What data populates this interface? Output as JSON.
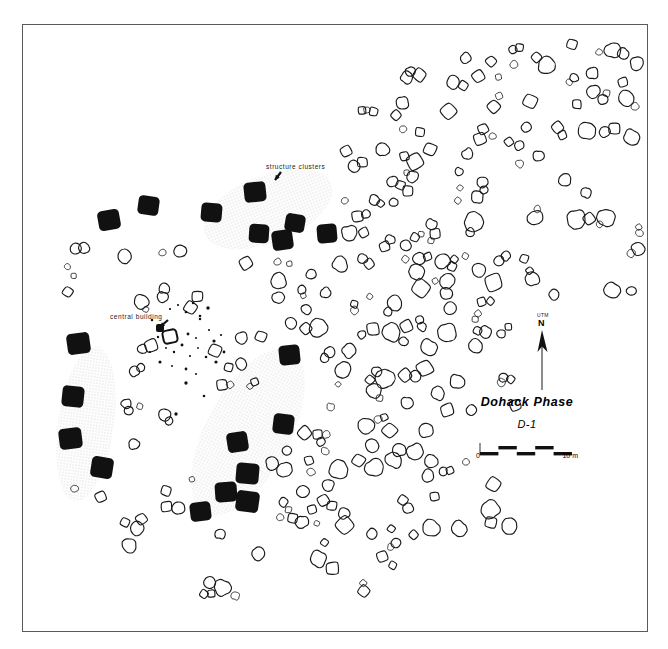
{
  "figure": {
    "type": "archaeological-site-plan",
    "border": {
      "x": 22,
      "y": 24,
      "width": 626,
      "height": 608,
      "stroke": "#59595e"
    }
  },
  "annotations": {
    "structure_clusters_label": "structure clusters",
    "central_building_label": "central building"
  },
  "legend": {
    "title": "Dohack Phase",
    "subtitle": "D-1",
    "scale_min_label": "0",
    "scale_max_label": "10 m",
    "scale_segments": 5
  },
  "north_arrow": {
    "datum_label": "UTM",
    "direction_label": "N"
  },
  "colors": {
    "structure_fill": "#111111",
    "feature_stroke": "#1a1a1a",
    "cluster_halo": "#e8e8e8",
    "border": "#59595e",
    "background": "#ffffff"
  },
  "map_data": {
    "cluster_halos": [
      {
        "cx": 268,
        "cy": 209,
        "rx": 68,
        "ry": 34,
        "rot": -22
      },
      {
        "cx": 86,
        "cy": 424,
        "rx": 28,
        "ry": 78,
        "rot": 8
      },
      {
        "cx": 248,
        "cy": 432,
        "rx": 42,
        "ry": 92,
        "rot": 28
      }
    ],
    "structures": [
      {
        "x": 244,
        "y": 182,
        "w": 22,
        "h": 20,
        "rot": -6
      },
      {
        "x": 201,
        "y": 203,
        "w": 21,
        "h": 19,
        "rot": 5
      },
      {
        "x": 98,
        "y": 210,
        "w": 22,
        "h": 20,
        "rot": -10
      },
      {
        "x": 138,
        "y": 196,
        "w": 21,
        "h": 19,
        "rot": 8
      },
      {
        "x": 249,
        "y": 224,
        "w": 20,
        "h": 19,
        "rot": 4
      },
      {
        "x": 272,
        "y": 230,
        "w": 21,
        "h": 20,
        "rot": -8
      },
      {
        "x": 285,
        "y": 214,
        "w": 20,
        "h": 18,
        "rot": 10
      },
      {
        "x": 317,
        "y": 224,
        "w": 20,
        "h": 19,
        "rot": -5
      },
      {
        "x": 67,
        "y": 333,
        "w": 23,
        "h": 21,
        "rot": -8
      },
      {
        "x": 62,
        "y": 386,
        "w": 22,
        "h": 21,
        "rot": 6
      },
      {
        "x": 59,
        "y": 428,
        "w": 23,
        "h": 21,
        "rot": -7
      },
      {
        "x": 91,
        "y": 457,
        "w": 22,
        "h": 21,
        "rot": 9
      },
      {
        "x": 279,
        "y": 345,
        "w": 21,
        "h": 20,
        "rot": -6
      },
      {
        "x": 273,
        "y": 414,
        "w": 21,
        "h": 20,
        "rot": 7
      },
      {
        "x": 227,
        "y": 432,
        "w": 21,
        "h": 20,
        "rot": -9
      },
      {
        "x": 236,
        "y": 463,
        "w": 23,
        "h": 21,
        "rot": 5
      },
      {
        "x": 215,
        "y": 482,
        "w": 22,
        "h": 20,
        "rot": -4
      },
      {
        "x": 236,
        "y": 491,
        "w": 23,
        "h": 21,
        "rot": 8
      },
      {
        "x": 190,
        "y": 502,
        "w": 21,
        "h": 19,
        "rot": -7
      }
    ],
    "central_building": {
      "x": 163,
      "y": 330,
      "w": 14,
      "h": 13
    },
    "postmolds": [
      [
        170,
        309
      ],
      [
        178,
        305
      ],
      [
        186,
        312
      ],
      [
        193,
        303
      ],
      [
        200,
        316
      ],
      [
        208,
        308
      ],
      [
        166,
        348
      ],
      [
        174,
        352
      ],
      [
        182,
        345
      ],
      [
        190,
        356
      ],
      [
        198,
        348
      ],
      [
        160,
        362
      ],
      [
        172,
        366
      ],
      [
        186,
        369
      ],
      [
        196,
        374
      ],
      [
        209,
        330
      ],
      [
        214,
        341
      ],
      [
        221,
        335
      ],
      [
        206,
        357
      ],
      [
        216,
        362
      ],
      [
        152,
        320
      ],
      [
        158,
        337
      ],
      [
        150,
        352
      ],
      [
        204,
        396
      ],
      [
        186,
        383
      ],
      [
        176,
        414
      ],
      [
        200,
        319
      ],
      [
        224,
        352
      ],
      [
        188,
        334
      ],
      [
        196,
        338
      ]
    ],
    "features_note": "open outline pits and basins distributed across the site; generated procedurally from seeded layout table"
  }
}
